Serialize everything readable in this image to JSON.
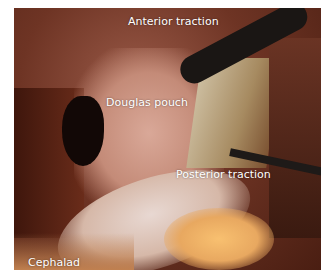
{
  "image": {
    "description": "Laparoscopic surgical view of pelvic cavity",
    "labels": {
      "anterior": "Anterior traction",
      "douglas": "Douglas pouch",
      "posterior": "Posterior traction",
      "cephalad": "Cephalad"
    }
  }
}
